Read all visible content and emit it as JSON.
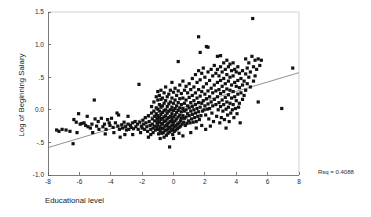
{
  "chart_data": {
    "type": "scatter",
    "title": "",
    "xlabel": "Educational level",
    "ylabel": "Log of Beginning Salary",
    "xlim": [
      -8,
      8
    ],
    "ylim": [
      -1.0,
      1.5
    ],
    "xticks": [
      -8,
      -6,
      -4,
      -2,
      0,
      2,
      4,
      6,
      8
    ],
    "xticklabels": [
      "-8",
      "-6",
      "-4",
      "-2",
      "0",
      "2",
      "4",
      "6",
      "8"
    ],
    "yticks": [
      -1.0,
      -0.5,
      0.0,
      0.5,
      1.0,
      1.5
    ],
    "yticklabels": [
      "-1.0",
      "-.5",
      "0.0",
      ".5",
      "1.0",
      "1.5"
    ],
    "grid": false,
    "legend": null,
    "annotations": [
      {
        "text": "Rsq = 0.4088",
        "x": 8.6,
        "y": -0.92
      }
    ],
    "fit_line": {
      "type": "linear-regression",
      "x": [
        -8,
        8
      ],
      "y": [
        -0.58,
        0.57
      ],
      "slope": 0.0719,
      "intercept": -0.005,
      "r_squared": 0.4088
    },
    "marker": {
      "shape": "square",
      "size": 1.6,
      "color": "#131313"
    },
    "points": [
      [
        -7.45,
        -0.31
      ],
      [
        -7.3,
        -0.33
      ],
      [
        -7.1,
        -0.3
      ],
      [
        -6.85,
        -0.31
      ],
      [
        -6.6,
        -0.33
      ],
      [
        -6.4,
        -0.52
      ],
      [
        -6.35,
        -0.15
      ],
      [
        -6.2,
        -0.19
      ],
      [
        -6.05,
        -0.06
      ],
      [
        -5.95,
        -0.22
      ],
      [
        -5.85,
        -0.21
      ],
      [
        -5.7,
        -0.2
      ],
      [
        -5.6,
        -0.24
      ],
      [
        -5.5,
        -0.1
      ],
      [
        -5.45,
        -0.26
      ],
      [
        -5.3,
        -0.28
      ],
      [
        -5.2,
        -0.22
      ],
      [
        -5.05,
        0.15
      ],
      [
        -5.0,
        -0.14
      ],
      [
        -4.9,
        -0.25
      ],
      [
        -4.8,
        -0.18
      ],
      [
        -4.75,
        -0.3
      ],
      [
        -4.6,
        -0.13
      ],
      [
        -4.5,
        -0.26
      ],
      [
        -4.4,
        -0.22
      ],
      [
        -4.3,
        -0.3
      ],
      [
        -4.2,
        -0.15
      ],
      [
        -4.1,
        -0.2
      ],
      [
        -4.05,
        -0.24
      ],
      [
        -3.95,
        -0.13
      ],
      [
        -3.85,
        -0.27
      ],
      [
        -3.8,
        -0.35
      ],
      [
        -3.7,
        -0.2
      ],
      [
        -3.6,
        -0.05
      ],
      [
        -3.55,
        -0.25
      ],
      [
        -3.45,
        -0.3
      ],
      [
        -3.4,
        -0.42
      ],
      [
        -3.3,
        -0.23
      ],
      [
        -3.25,
        -0.28
      ],
      [
        -3.15,
        -0.19
      ],
      [
        -3.05,
        -0.26
      ],
      [
        -3.0,
        -0.31
      ],
      [
        -2.9,
        -0.22
      ],
      [
        -2.85,
        -0.3
      ],
      [
        -2.75,
        -0.24
      ],
      [
        -2.7,
        -0.27
      ],
      [
        -2.6,
        -0.2
      ],
      [
        -2.55,
        -0.29
      ],
      [
        -2.45,
        -0.18
      ],
      [
        -2.4,
        -0.26
      ],
      [
        -2.3,
        -0.22
      ],
      [
        -2.25,
        -0.3
      ],
      [
        -2.2,
        0.39
      ],
      [
        -2.15,
        -0.19
      ],
      [
        -2.05,
        -0.25
      ],
      [
        -2.0,
        -0.28
      ],
      [
        -1.95,
        -0.16
      ],
      [
        -1.9,
        -0.22
      ],
      [
        -1.85,
        -0.3
      ],
      [
        -1.8,
        -0.12
      ],
      [
        -1.75,
        -0.2
      ],
      [
        -1.7,
        -0.26
      ],
      [
        -1.65,
        -0.33
      ],
      [
        -1.6,
        -0.09
      ],
      [
        -1.55,
        -0.18
      ],
      [
        -1.5,
        -0.24
      ],
      [
        -1.45,
        -0.3
      ],
      [
        -1.4,
        0.05
      ],
      [
        -1.4,
        -0.05
      ],
      [
        -1.35,
        -0.14
      ],
      [
        -1.35,
        -0.22
      ],
      [
        -1.3,
        -0.28
      ],
      [
        -1.3,
        -0.35
      ],
      [
        -1.25,
        0.12
      ],
      [
        -1.25,
        -0.02
      ],
      [
        -1.2,
        -0.1
      ],
      [
        -1.2,
        -0.17
      ],
      [
        -1.2,
        -0.25
      ],
      [
        -1.15,
        -0.31
      ],
      [
        -1.1,
        0.2
      ],
      [
        -1.1,
        0.03
      ],
      [
        -1.1,
        -0.06
      ],
      [
        -1.05,
        -0.13
      ],
      [
        -1.05,
        -0.2
      ],
      [
        -1.05,
        -0.27
      ],
      [
        -1.0,
        0.28
      ],
      [
        -1.0,
        0.15
      ],
      [
        -1.0,
        0.01
      ],
      [
        -1.0,
        -0.09
      ],
      [
        -1.0,
        -0.16
      ],
      [
        -1.0,
        -0.23
      ],
      [
        -0.95,
        -0.3
      ],
      [
        -0.95,
        -0.37
      ],
      [
        -0.9,
        0.22
      ],
      [
        -0.9,
        0.08
      ],
      [
        -0.9,
        -0.02
      ],
      [
        -0.9,
        -0.12
      ],
      [
        -0.9,
        -0.19
      ],
      [
        -0.85,
        -0.26
      ],
      [
        -0.85,
        -0.33
      ],
      [
        -0.8,
        0.3
      ],
      [
        -0.8,
        0.16
      ],
      [
        -0.8,
        0.04
      ],
      [
        -0.8,
        -0.07
      ],
      [
        -0.8,
        -0.15
      ],
      [
        -0.75,
        -0.22
      ],
      [
        -0.75,
        -0.29
      ],
      [
        -0.75,
        -0.36
      ],
      [
        -0.7,
        0.18
      ],
      [
        -0.7,
        0.06
      ],
      [
        -0.7,
        -0.04
      ],
      [
        -0.7,
        -0.13
      ],
      [
        -0.7,
        -0.21
      ],
      [
        -0.65,
        -0.28
      ],
      [
        -0.65,
        -0.35
      ],
      [
        -0.6,
        0.26
      ],
      [
        -0.6,
        0.1
      ],
      [
        -0.6,
        -0.01
      ],
      [
        -0.6,
        -0.11
      ],
      [
        -0.6,
        -0.18
      ],
      [
        -0.55,
        -0.25
      ],
      [
        -0.55,
        -0.32
      ],
      [
        -0.5,
        0.35
      ],
      [
        -0.5,
        0.14
      ],
      [
        -0.5,
        0.0
      ],
      [
        -0.5,
        -0.09
      ],
      [
        -0.5,
        -0.17
      ],
      [
        -0.45,
        -0.24
      ],
      [
        -0.45,
        -0.31
      ],
      [
        -0.45,
        -0.39
      ],
      [
        -0.4,
        0.2
      ],
      [
        -0.4,
        0.05
      ],
      [
        -0.4,
        -0.05
      ],
      [
        -0.4,
        -0.14
      ],
      [
        -0.4,
        -0.22
      ],
      [
        -0.35,
        -0.29
      ],
      [
        -0.35,
        -0.36
      ],
      [
        -0.3,
        0.24
      ],
      [
        -0.3,
        0.09
      ],
      [
        -0.3,
        -0.02
      ],
      [
        -0.3,
        -0.12
      ],
      [
        -0.3,
        -0.2
      ],
      [
        -0.25,
        -0.27
      ],
      [
        -0.25,
        -0.34
      ],
      [
        -0.25,
        -0.57
      ],
      [
        -0.2,
        0.3
      ],
      [
        -0.2,
        0.12
      ],
      [
        -0.2,
        0.0
      ],
      [
        -0.2,
        -0.1
      ],
      [
        -0.2,
        -0.18
      ],
      [
        -0.15,
        -0.25
      ],
      [
        -0.15,
        -0.32
      ],
      [
        -0.1,
        0.42
      ],
      [
        -0.1,
        0.18
      ],
      [
        -0.1,
        0.04
      ],
      [
        -0.1,
        -0.06
      ],
      [
        -0.1,
        -0.15
      ],
      [
        -0.05,
        -0.23
      ],
      [
        -0.05,
        -0.3
      ],
      [
        -0.05,
        -0.38
      ],
      [
        0.0,
        0.27
      ],
      [
        0.0,
        0.1
      ],
      [
        0.0,
        -0.01
      ],
      [
        0.0,
        -0.11
      ],
      [
        0.0,
        -0.19
      ],
      [
        0.05,
        -0.26
      ],
      [
        0.05,
        -0.33
      ],
      [
        0.1,
        0.33
      ],
      [
        0.1,
        0.15
      ],
      [
        0.1,
        0.02
      ],
      [
        0.1,
        -0.08
      ],
      [
        0.1,
        -0.17
      ],
      [
        0.15,
        -0.24
      ],
      [
        0.15,
        -0.31
      ],
      [
        0.2,
        0.22
      ],
      [
        0.2,
        0.06
      ],
      [
        0.2,
        -0.04
      ],
      [
        0.2,
        -0.14
      ],
      [
        0.25,
        -0.22
      ],
      [
        0.25,
        -0.29
      ],
      [
        0.3,
        0.74
      ],
      [
        0.3,
        0.29
      ],
      [
        0.3,
        0.11
      ],
      [
        0.3,
        -0.01
      ],
      [
        0.3,
        -0.11
      ],
      [
        0.35,
        -0.2
      ],
      [
        0.35,
        -0.27
      ],
      [
        0.4,
        0.38
      ],
      [
        0.4,
        0.17
      ],
      [
        0.4,
        0.03
      ],
      [
        0.4,
        -0.08
      ],
      [
        0.45,
        -0.17
      ],
      [
        0.45,
        -0.25
      ],
      [
        0.5,
        0.25
      ],
      [
        0.5,
        0.08
      ],
      [
        0.5,
        -0.03
      ],
      [
        0.5,
        -0.13
      ],
      [
        0.55,
        -0.22
      ],
      [
        0.6,
        0.44
      ],
      [
        0.6,
        0.18
      ],
      [
        0.6,
        0.02
      ],
      [
        0.6,
        -0.09
      ],
      [
        0.65,
        -0.19
      ],
      [
        0.7,
        0.3
      ],
      [
        0.7,
        0.1
      ],
      [
        0.7,
        -0.02
      ],
      [
        0.7,
        -0.13
      ],
      [
        0.75,
        -0.24
      ],
      [
        0.8,
        0.36
      ],
      [
        0.8,
        0.15
      ],
      [
        0.8,
        0.0
      ],
      [
        0.8,
        -0.11
      ],
      [
        0.85,
        -0.21
      ],
      [
        0.9,
        0.26
      ],
      [
        0.9,
        0.06
      ],
      [
        0.9,
        -0.06
      ],
      [
        0.95,
        -0.17
      ],
      [
        1.0,
        0.4
      ],
      [
        1.0,
        0.19
      ],
      [
        1.0,
        0.03
      ],
      [
        1.0,
        -0.09
      ],
      [
        1.05,
        -0.2
      ],
      [
        1.1,
        0.31
      ],
      [
        1.1,
        0.11
      ],
      [
        1.1,
        -0.02
      ],
      [
        1.15,
        -0.14
      ],
      [
        1.2,
        0.48
      ],
      [
        1.2,
        0.22
      ],
      [
        1.2,
        0.05
      ],
      [
        1.2,
        -0.07
      ],
      [
        1.25,
        -0.19
      ],
      [
        1.3,
        0.35
      ],
      [
        1.3,
        0.14
      ],
      [
        1.3,
        0.0
      ],
      [
        1.35,
        -0.12
      ],
      [
        1.4,
        0.54
      ],
      [
        1.4,
        0.26
      ],
      [
        1.4,
        0.08
      ],
      [
        1.4,
        -0.05
      ],
      [
        1.45,
        -0.18
      ],
      [
        1.5,
        0.42
      ],
      [
        1.5,
        0.18
      ],
      [
        1.5,
        0.02
      ],
      [
        1.55,
        -0.1
      ],
      [
        1.6,
        1.12
      ],
      [
        1.6,
        0.6
      ],
      [
        1.6,
        0.31
      ],
      [
        1.6,
        0.11
      ],
      [
        1.6,
        -0.03
      ],
      [
        1.65,
        -0.15
      ],
      [
        1.7,
        0.88
      ],
      [
        1.7,
        0.46
      ],
      [
        1.7,
        0.21
      ],
      [
        1.7,
        0.04
      ],
      [
        1.75,
        -0.09
      ],
      [
        1.8,
        0.56
      ],
      [
        1.8,
        0.28
      ],
      [
        1.8,
        0.1
      ],
      [
        1.8,
        -0.24
      ],
      [
        1.85,
        -0.02
      ],
      [
        1.9,
        0.64
      ],
      [
        1.9,
        0.35
      ],
      [
        1.9,
        0.14
      ],
      [
        1.95,
        0.0
      ],
      [
        2.0,
        0.5
      ],
      [
        2.0,
        0.24
      ],
      [
        2.0,
        0.06
      ],
      [
        2.05,
        -0.08
      ],
      [
        2.1,
        0.97
      ],
      [
        2.1,
        0.4
      ],
      [
        2.1,
        0.17
      ],
      [
        2.15,
        0.01
      ],
      [
        2.2,
        0.96
      ],
      [
        2.2,
        0.58
      ],
      [
        2.2,
        0.29
      ],
      [
        2.2,
        0.09
      ],
      [
        2.25,
        -0.14
      ],
      [
        2.3,
        0.45
      ],
      [
        2.3,
        0.2
      ],
      [
        2.3,
        0.02
      ],
      [
        2.4,
        0.62
      ],
      [
        2.4,
        0.33
      ],
      [
        2.4,
        0.12
      ],
      [
        2.45,
        -0.05
      ],
      [
        2.5,
        0.52
      ],
      [
        2.5,
        0.26
      ],
      [
        2.5,
        0.06
      ],
      [
        2.55,
        -0.18
      ],
      [
        2.6,
        0.68
      ],
      [
        2.6,
        0.38
      ],
      [
        2.6,
        0.16
      ],
      [
        2.7,
        0.56
      ],
      [
        2.7,
        0.29
      ],
      [
        2.7,
        0.08
      ],
      [
        2.75,
        -0.1
      ],
      [
        2.8,
        0.82
      ],
      [
        2.8,
        0.62
      ],
      [
        2.8,
        0.42
      ],
      [
        2.8,
        0.2
      ],
      [
        2.85,
        0.0
      ],
      [
        2.9,
        0.52
      ],
      [
        2.9,
        0.31
      ],
      [
        2.9,
        0.11
      ],
      [
        2.95,
        -0.2
      ],
      [
        3.0,
        0.83
      ],
      [
        3.0,
        0.66
      ],
      [
        3.0,
        0.45
      ],
      [
        3.0,
        0.25
      ],
      [
        3.0,
        0.05
      ],
      [
        3.05,
        -0.12
      ],
      [
        3.1,
        0.58
      ],
      [
        3.1,
        0.36
      ],
      [
        3.1,
        0.15
      ],
      [
        3.15,
        -0.02
      ],
      [
        3.2,
        0.72
      ],
      [
        3.2,
        0.48
      ],
      [
        3.2,
        0.28
      ],
      [
        3.2,
        0.08
      ],
      [
        3.25,
        -0.15
      ],
      [
        3.3,
        0.62
      ],
      [
        3.3,
        0.4
      ],
      [
        3.3,
        0.19
      ],
      [
        3.35,
        0.01
      ],
      [
        3.4,
        0.76
      ],
      [
        3.4,
        0.54
      ],
      [
        3.4,
        0.32
      ],
      [
        3.4,
        0.12
      ],
      [
        3.45,
        -0.08
      ],
      [
        3.5,
        0.66
      ],
      [
        3.5,
        0.44
      ],
      [
        3.5,
        0.23
      ],
      [
        3.5,
        0.04
      ],
      [
        3.55,
        -0.18
      ],
      [
        3.6,
        0.7
      ],
      [
        3.6,
        0.5
      ],
      [
        3.6,
        0.3
      ],
      [
        3.6,
        0.1
      ],
      [
        3.65,
        -0.05
      ],
      [
        3.7,
        0.6
      ],
      [
        3.7,
        0.38
      ],
      [
        3.7,
        0.18
      ],
      [
        3.75,
        0.0
      ],
      [
        3.8,
        0.72
      ],
      [
        3.8,
        0.52
      ],
      [
        3.8,
        0.28
      ],
      [
        3.8,
        0.08
      ],
      [
        3.85,
        -0.12
      ],
      [
        3.9,
        0.62
      ],
      [
        3.9,
        0.42
      ],
      [
        3.9,
        0.2
      ],
      [
        3.95,
        0.02
      ],
      [
        4.0,
        0.58
      ],
      [
        4.0,
        0.36
      ],
      [
        4.0,
        0.14
      ],
      [
        4.05,
        -0.06
      ],
      [
        4.1,
        0.66
      ],
      [
        4.1,
        0.45
      ],
      [
        4.1,
        0.24
      ],
      [
        4.15,
        0.04
      ],
      [
        4.2,
        0.56
      ],
      [
        4.2,
        0.34
      ],
      [
        4.2,
        0.1
      ],
      [
        4.25,
        -0.2
      ],
      [
        4.3,
        0.48
      ],
      [
        4.3,
        0.26
      ],
      [
        4.4,
        0.6
      ],
      [
        4.4,
        0.38
      ],
      [
        4.4,
        0.16
      ],
      [
        4.5,
        0.44
      ],
      [
        4.5,
        0.22
      ],
      [
        4.6,
        0.78
      ],
      [
        4.6,
        0.55
      ],
      [
        4.6,
        0.3
      ],
      [
        4.7,
        0.64
      ],
      [
        4.7,
        0.4
      ],
      [
        4.8,
        0.72
      ],
      [
        4.8,
        0.5
      ],
      [
        4.9,
        0.58
      ],
      [
        4.9,
        0.35
      ],
      [
        5.0,
        0.82
      ],
      [
        5.05,
        1.4
      ],
      [
        5.1,
        0.66
      ],
      [
        5.1,
        0.44
      ],
      [
        5.2,
        0.76
      ],
      [
        5.2,
        0.52
      ],
      [
        5.3,
        0.62
      ],
      [
        5.4,
        0.78
      ],
      [
        5.4,
        0.12
      ],
      [
        5.5,
        0.68
      ],
      [
        5.6,
        0.76
      ],
      [
        6.9,
        0.02
      ],
      [
        7.6,
        0.64
      ],
      [
        -6.15,
        -0.35
      ],
      [
        -5.15,
        -0.35
      ],
      [
        -4.35,
        -0.37
      ],
      [
        -3.1,
        -0.38
      ],
      [
        -2.6,
        -0.38
      ],
      [
        -1.6,
        -0.42
      ],
      [
        -0.85,
        -0.44
      ],
      [
        0.0,
        -0.44
      ],
      [
        0.6,
        -0.4
      ],
      [
        1.1,
        -0.35
      ],
      [
        2.05,
        -0.3
      ],
      [
        -3.5,
        -0.08
      ],
      [
        -2.9,
        -0.1
      ],
      [
        -2.1,
        -0.35
      ],
      [
        -1.45,
        -0.38
      ],
      [
        -0.6,
        -0.42
      ],
      [
        0.35,
        -0.36
      ],
      [
        1.45,
        -0.28
      ],
      [
        2.35,
        -0.25
      ],
      [
        3.35,
        -0.28
      ]
    ]
  }
}
